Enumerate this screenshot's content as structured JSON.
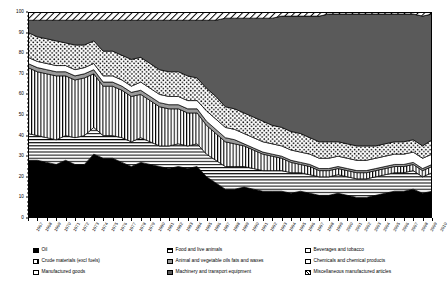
{
  "chart_data": {
    "type": "area",
    "title": "",
    "subtitle": "",
    "xlabel": "",
    "ylabel": "Percent",
    "ylim": [
      0,
      100
    ],
    "ytick_step": 10,
    "yticks": [
      0,
      10,
      20,
      30,
      40,
      50,
      60,
      70,
      80,
      90,
      100
    ],
    "grid": false,
    "legend_position": "bottom",
    "stacked": true,
    "normalized_percent": true,
    "x": [
      1967,
      1968,
      1969,
      1970,
      1971,
      1972,
      1973,
      1974,
      1975,
      1976,
      1977,
      1978,
      1979,
      1980,
      1981,
      1982,
      1983,
      1984,
      1985,
      1986,
      1987,
      1988,
      1989,
      1990,
      1991,
      1992,
      1993,
      1994,
      1995,
      1996,
      1997,
      1998,
      1999,
      2000,
      2001,
      2002,
      2003,
      2004,
      2005,
      2006,
      2007,
      2008,
      2009,
      2010
    ],
    "series": [
      {
        "name": "Oil",
        "key": "oil",
        "pattern": "solid-black",
        "values": [
          28,
          28,
          27,
          26,
          28,
          26,
          26,
          31,
          29,
          29,
          27,
          25,
          27,
          26,
          25,
          24,
          25,
          24,
          25,
          20,
          17,
          14,
          14,
          15,
          14,
          13,
          13,
          13,
          12,
          13,
          12,
          11,
          11,
          12,
          11,
          10,
          10,
          11,
          12,
          13,
          13,
          14,
          12,
          13
        ]
      },
      {
        "name": "Manufactured goods",
        "key": "manufactured_goods",
        "pattern": "horizontal-lines",
        "values": [
          13,
          12,
          12,
          12,
          12,
          13,
          14,
          13,
          11,
          11,
          12,
          12,
          12,
          11,
          10,
          11,
          11,
          11,
          11,
          11,
          11,
          11,
          11,
          10,
          10,
          10,
          10,
          10,
          10,
          9,
          9,
          9,
          9,
          9,
          9,
          9,
          9,
          9,
          9,
          9,
          9,
          9,
          8,
          9
        ]
      },
      {
        "name": "Crude materials (excl fuels)",
        "key": "crude_materials",
        "pattern": "vertical-lines",
        "values": [
          32,
          31,
          31,
          31,
          29,
          28,
          28,
          26,
          24,
          24,
          23,
          22,
          21,
          20,
          19,
          18,
          17,
          16,
          15,
          14,
          13,
          12,
          11,
          10,
          9,
          8,
          7,
          6,
          5,
          4,
          4,
          3,
          3,
          3,
          3,
          3,
          3,
          3,
          3,
          3,
          3,
          3,
          3,
          3
        ]
      },
      {
        "name": "Animal and vegetable oils fats and waxes",
        "key": "animal_vegetable_oils",
        "pattern": "grey-mid",
        "values": [
          2,
          2,
          2,
          2,
          2,
          2,
          2,
          2,
          2,
          2,
          2,
          2,
          2,
          2,
          2,
          2,
          2,
          2,
          2,
          2,
          2,
          2,
          2,
          1,
          1,
          1,
          1,
          1,
          1,
          1,
          1,
          1,
          1,
          1,
          1,
          1,
          1,
          1,
          1,
          1,
          1,
          1,
          1,
          1
        ]
      },
      {
        "name": "Beverages and tobacco",
        "key": "beverages_tobacco",
        "pattern": "white",
        "values": [
          3,
          3,
          3,
          3,
          3,
          3,
          3,
          3,
          3,
          3,
          3,
          3,
          4,
          4,
          4,
          4,
          4,
          4,
          4,
          5,
          5,
          5,
          5,
          5,
          5,
          5,
          5,
          5,
          5,
          5,
          5,
          5,
          5,
          5,
          5,
          5,
          5,
          5,
          5,
          5,
          5,
          5,
          5,
          5
        ]
      },
      {
        "name": "Food and live animals",
        "key": "food_live_animals",
        "pattern": "dotted",
        "values": [
          12,
          12,
          12,
          12,
          11,
          12,
          11,
          11,
          12,
          12,
          12,
          13,
          12,
          12,
          12,
          12,
          12,
          12,
          11,
          11,
          11,
          10,
          10,
          10,
          10,
          10,
          9,
          9,
          9,
          9,
          8,
          8,
          8,
          7,
          7,
          7,
          7,
          6,
          6,
          6,
          6,
          6,
          6,
          7
        ]
      },
      {
        "name": "Machinery and transport equipment",
        "key": "machinery_transport",
        "pattern": "grey-dark",
        "values": [
          6,
          8,
          9,
          10,
          11,
          12,
          12,
          10,
          15,
          15,
          17,
          19,
          18,
          21,
          24,
          25,
          25,
          27,
          28,
          33,
          37,
          43,
          44,
          46,
          48,
          50,
          52,
          54,
          56,
          57,
          59,
          61,
          62,
          62,
          63,
          64,
          64,
          64,
          63,
          62,
          62,
          61,
          63,
          61
        ]
      },
      {
        "name": "Miscellaneous manufactured articles",
        "key": "misc_manufactured",
        "pattern": "diagonal-hatch",
        "values": [
          4,
          4,
          4,
          4,
          4,
          4,
          4,
          4,
          4,
          4,
          4,
          4,
          4,
          4,
          4,
          4,
          4,
          4,
          4,
          4,
          4,
          3,
          3,
          3,
          3,
          3,
          3,
          2,
          2,
          2,
          2,
          2,
          1,
          1,
          1,
          1,
          1,
          1,
          1,
          1,
          1,
          1,
          2,
          1
        ]
      }
    ]
  },
  "axes": {
    "y_title": "Percent"
  },
  "legend": {
    "columns": [
      {
        "items": [
          {
            "label": "Oil",
            "swatch": "sw-oil",
            "icon": "legend-swatch-oil"
          },
          {
            "label": "Crude materials (excl fuels)",
            "swatch": "sw-crude",
            "icon": "legend-swatch-crude-materials"
          },
          {
            "label": "Manufactured goods",
            "swatch": "sw-manu",
            "icon": "legend-swatch-manufactured-goods"
          }
        ]
      },
      {
        "items": [
          {
            "label": "Food and live animals",
            "swatch": "sw-food",
            "icon": "legend-swatch-food-live-animals"
          },
          {
            "label": "Animal and vegetable oils fats and waxes",
            "swatch": "sw-anim",
            "icon": "legend-swatch-animal-vegetable-oils"
          },
          {
            "label": "Machinery and transport equipment",
            "swatch": "sw-mach",
            "icon": "legend-swatch-machinery-transport"
          }
        ]
      },
      {
        "items": [
          {
            "label": "Beverages and tobacco",
            "swatch": "sw-bev",
            "icon": "legend-swatch-beverages-tobacco"
          },
          {
            "label": "Chemicals and chemical products",
            "swatch": "sw-chem",
            "icon": "legend-swatch-chemicals"
          },
          {
            "label": "Miscellaneous manufactured articles",
            "swatch": "sw-misc",
            "icon": "legend-swatch-misc-manufactured"
          }
        ]
      }
    ]
  },
  "colors": {
    "ink": "#000000",
    "grey_mid": "#9a9a9a",
    "grey_dark": "#5a5a5a",
    "paper": "#ffffff"
  }
}
